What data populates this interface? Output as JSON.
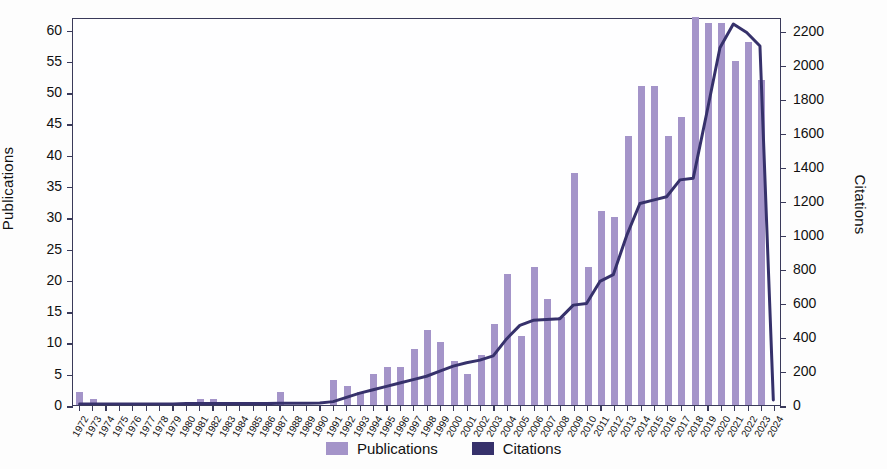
{
  "chart_data": {
    "type": "bar",
    "title": "",
    "xlabel": "",
    "ylabel": "Publications",
    "y2label": "Citations",
    "ylim": [
      0,
      62
    ],
    "y2lim": [
      0,
      2280
    ],
    "yticks": [
      0,
      5,
      10,
      15,
      20,
      25,
      30,
      35,
      40,
      45,
      50,
      55,
      60
    ],
    "y2ticks": [
      0,
      200,
      400,
      600,
      800,
      1000,
      1200,
      1400,
      1600,
      1800,
      2000,
      2200
    ],
    "grid": false,
    "legend_position": "bottom-center",
    "categories": [
      "1972",
      "1973",
      "1974",
      "1975",
      "1976",
      "1977",
      "1978",
      "1979",
      "1980",
      "1981",
      "1982",
      "1983",
      "1984",
      "1985",
      "1986",
      "1987",
      "1988",
      "1989",
      "1990",
      "1991",
      "1992",
      "1993",
      "1994",
      "1995",
      "1996",
      "1997",
      "1998",
      "1999",
      "2000",
      "2001",
      "2002",
      "2003",
      "2004",
      "2005",
      "2006",
      "2007",
      "2008",
      "2009",
      "2010",
      "2011",
      "2012",
      "2013",
      "2014",
      "2015",
      "2016",
      "2017",
      "2018",
      "2019",
      "2020",
      "2021",
      "2022",
      "2023",
      "2024"
    ],
    "series": [
      {
        "name": "Publications",
        "type": "bar",
        "axis": "left",
        "color": "#a494c9",
        "values": [
          2,
          1,
          0,
          0,
          0,
          0,
          0,
          0,
          0,
          1,
          1,
          0,
          0,
          0,
          0,
          2,
          0,
          0,
          0,
          4,
          3,
          2,
          5,
          6,
          6,
          9,
          12,
          10,
          7,
          5,
          8,
          13,
          21,
          11,
          22,
          17,
          14,
          37,
          22,
          31,
          30,
          43,
          51,
          51,
          43,
          46,
          62,
          61,
          61,
          55,
          58,
          52,
          0
        ]
      },
      {
        "name": "Citations",
        "type": "line",
        "axis": "right",
        "color": "#36316b",
        "values": [
          5,
          5,
          5,
          5,
          5,
          5,
          5,
          5,
          8,
          8,
          8,
          8,
          8,
          8,
          8,
          10,
          10,
          10,
          12,
          20,
          45,
          70,
          90,
          110,
          130,
          150,
          170,
          200,
          230,
          250,
          265,
          290,
          390,
          470,
          500,
          505,
          510,
          590,
          600,
          730,
          770,
          1000,
          1190,
          1210,
          1230,
          1330,
          1340,
          1720,
          2110,
          2250,
          2200,
          2120,
          30
        ]
      }
    ]
  },
  "legend": {
    "items": [
      {
        "label": "Publications",
        "color": "#a494c9"
      },
      {
        "label": "Citations",
        "color": "#36316b"
      }
    ]
  }
}
